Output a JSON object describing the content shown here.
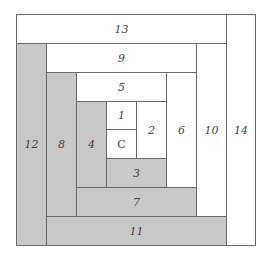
{
  "diagram": {
    "colors": {
      "light": "#ffffff",
      "dark": "#c9c9c9",
      "line": "#6a6a6a",
      "text": "#444444"
    },
    "pieces": [
      {
        "id": "13",
        "label": "13",
        "tone": "light"
      },
      {
        "id": "14",
        "label": "14",
        "tone": "light"
      },
      {
        "id": "12",
        "label": "12",
        "tone": "dark"
      },
      {
        "id": "9",
        "label": "9",
        "tone": "light"
      },
      {
        "id": "10",
        "label": "10",
        "tone": "light"
      },
      {
        "id": "8",
        "label": "8",
        "tone": "dark"
      },
      {
        "id": "11",
        "label": "11",
        "tone": "dark"
      },
      {
        "id": "5",
        "label": "5",
        "tone": "light"
      },
      {
        "id": "6",
        "label": "6",
        "tone": "light"
      },
      {
        "id": "4",
        "label": "4",
        "tone": "dark"
      },
      {
        "id": "7",
        "label": "7",
        "tone": "dark"
      },
      {
        "id": "1",
        "label": "1",
        "tone": "light"
      },
      {
        "id": "C",
        "label": "C",
        "tone": "light"
      },
      {
        "id": "2",
        "label": "2",
        "tone": "light"
      },
      {
        "id": "3",
        "label": "3",
        "tone": "dark"
      }
    ]
  }
}
